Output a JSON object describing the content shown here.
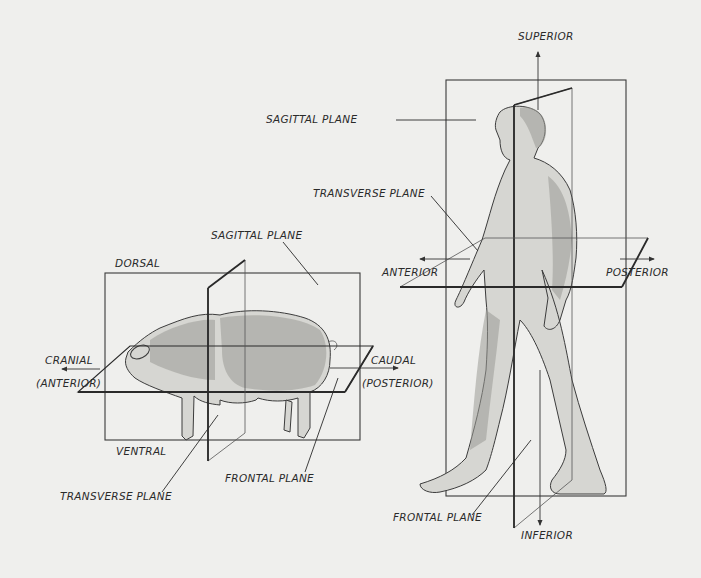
{
  "colors": {
    "background": "#efefed",
    "ink": "#2a2a2a",
    "body_fill": "#d6d6d2"
  },
  "pig": {
    "labels": {
      "sagittal_plane": "SAGITTAL PLANE",
      "dorsal": "DORSAL",
      "cranial": "CRANIAL",
      "anterior": "(ANTERIOR)",
      "caudal": "CAUDAL",
      "posterior": "(POSTERIOR)",
      "ventral": "VENTRAL",
      "transverse_plane": "TRANSVERSE PLANE",
      "frontal_plane": "FRONTAL PLANE"
    }
  },
  "human": {
    "labels": {
      "superior": "SUPERIOR",
      "sagittal_plane": "SAGITTAL PLANE",
      "transverse_plane": "TRANSVERSE PLANE",
      "anterior": "ANTERIOR",
      "posterior": "POSTERIOR",
      "frontal_plane": "FRONTAL PLANE",
      "inferior": "INFERIOR"
    }
  }
}
